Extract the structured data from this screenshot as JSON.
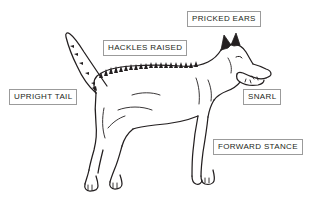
{
  "diagram": {
    "style": {
      "background_color": "#ffffff",
      "line_color": "#231f20",
      "label_border_color": "#9b9b9b",
      "label_text_color": "#231f20",
      "label_background_color": "#ffffff"
    },
    "callouts": [
      {
        "id": "pricked-ears",
        "label": "PRICKED EARS",
        "points_to": "ears"
      },
      {
        "id": "hackles-raised",
        "label": "HACKLES RAISED",
        "points_to": "back"
      },
      {
        "id": "upright-tail",
        "label": "UPRIGHT TAIL",
        "points_to": "tail"
      },
      {
        "id": "snarl",
        "label": "SNARL",
        "points_to": "muzzle"
      },
      {
        "id": "forward-stance",
        "label": "FORWARD STANCE",
        "points_to": "front-legs"
      }
    ]
  }
}
